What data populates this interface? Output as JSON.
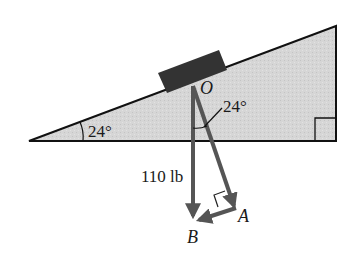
{
  "diagram": {
    "type": "inclined-plane-force-diagram",
    "incline_angle_label": "24°",
    "vector_angle_label": "24°",
    "point_O_label": "O",
    "point_A_label": "A",
    "point_B_label": "B",
    "weight_label": "110 lb",
    "colors": {
      "incline_fill": "#d4d4d4",
      "outline": "#111111",
      "block": "#333333",
      "vector": "#555555"
    }
  }
}
